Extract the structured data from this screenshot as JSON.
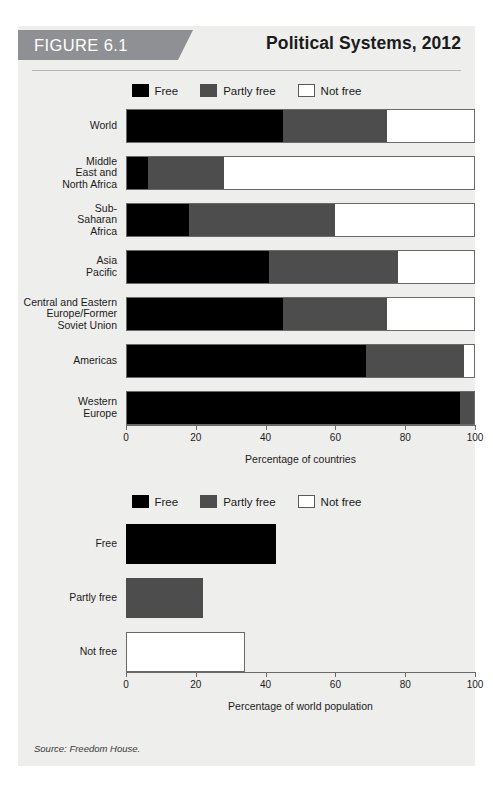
{
  "figure": {
    "banner_label": "FIGURE 6.1",
    "title": "Political Systems, 2012",
    "source": "Source: Freedom House."
  },
  "legend": {
    "items": [
      {
        "label": "Free",
        "color": "#000000",
        "key": "free"
      },
      {
        "label": "Partly free",
        "color": "#4d4d4d",
        "key": "partly"
      },
      {
        "label": "Not free",
        "color": "#ffffff",
        "key": "not"
      }
    ]
  },
  "axis": {
    "ticks": [
      "0",
      "20",
      "40",
      "60",
      "80",
      "100"
    ],
    "countries_title": "Percentage of countries",
    "population_title": "Percentage of world population"
  },
  "chart_data": [
    {
      "type": "bar",
      "orientation": "horizontal",
      "stacked": true,
      "title": "Political Systems, 2012",
      "xlabel": "Percentage of countries",
      "ylabel": "",
      "xlim": [
        0,
        100
      ],
      "xticks": [
        0,
        20,
        40,
        60,
        80,
        100
      ],
      "grid": false,
      "legend": [
        "Free",
        "Partly free",
        "Not free"
      ],
      "legend_position": "top-center",
      "categories": [
        "World",
        "Middle East and North Africa",
        "Sub-Saharan Africa",
        "Asia Pacific",
        "Central and Eastern Europe/Former Soviet Union",
        "Americas",
        "Western Europe"
      ],
      "category_display": [
        "World",
        "Middle\nEast and\nNorth Africa",
        "Sub-\nSaharan\nAfrica",
        "Asia\nPacific",
        "Central and Eastern\nEurope/Former\nSoviet Union",
        "Americas",
        "Western\nEurope"
      ],
      "series": [
        {
          "name": "Free",
          "color": "#000000",
          "values": [
            45,
            6,
            18,
            41,
            45,
            69,
            96
          ]
        },
        {
          "name": "Partly free",
          "color": "#4d4d4d",
          "values": [
            30,
            22,
            42,
            37,
            30,
            28,
            4
          ]
        },
        {
          "name": "Not free",
          "color": "#ffffff",
          "values": [
            25,
            72,
            40,
            22,
            25,
            3,
            0
          ]
        }
      ]
    },
    {
      "type": "bar",
      "orientation": "horizontal",
      "stacked": false,
      "title": "",
      "xlabel": "Percentage of world population",
      "ylabel": "",
      "xlim": [
        0,
        100
      ],
      "xticks": [
        0,
        20,
        40,
        60,
        80,
        100
      ],
      "grid": false,
      "legend": [
        "Free",
        "Partly free",
        "Not free"
      ],
      "legend_position": "top-center",
      "categories": [
        "Free",
        "Partly free",
        "Not free"
      ],
      "values": [
        43,
        22,
        34
      ],
      "colors": [
        "#000000",
        "#4d4d4d",
        "#ffffff"
      ]
    }
  ]
}
